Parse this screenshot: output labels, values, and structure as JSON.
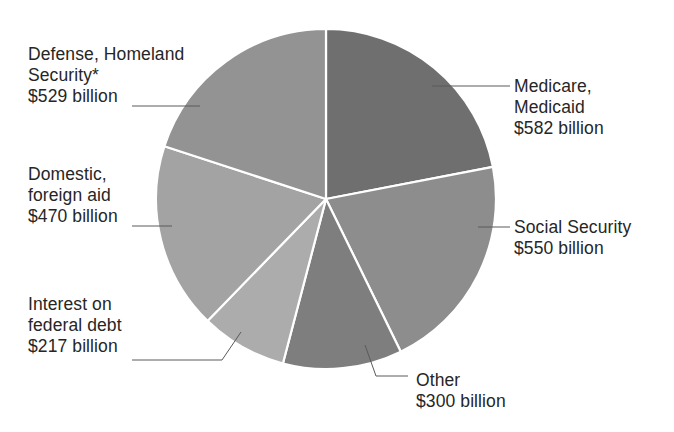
{
  "chart_data": {
    "type": "pie",
    "title": "",
    "unit": "billion USD",
    "start_angle_deg": 0,
    "direction": "clockwise",
    "slices": [
      {
        "name": "Medicare, Medicaid",
        "value": 582,
        "color": "#6f6f6f"
      },
      {
        "name": "Social Security",
        "value": 550,
        "color": "#8d8d8d"
      },
      {
        "name": "Other",
        "value": 300,
        "color": "#7e7e7e"
      },
      {
        "name": "Interest on federal debt",
        "value": 217,
        "color": "#acacac"
      },
      {
        "name": "Domestic, foreign aid",
        "value": 470,
        "color": "#a3a3a3"
      },
      {
        "name": "Defense, Homeland Security*",
        "value": 529,
        "color": "#939393"
      }
    ],
    "total": 2648
  },
  "labels": {
    "medicare": {
      "line1": "Medicare,",
      "line2": "Medicaid",
      "value": "$582 billion"
    },
    "social_security": {
      "line1": "Social Security",
      "value": "$550 billion"
    },
    "other": {
      "line1": "Other",
      "value": "$300 billion"
    },
    "interest": {
      "line1": "Interest on",
      "line2": "federal debt",
      "value": "$217 billion"
    },
    "domestic": {
      "line1": "Domestic,",
      "line2": "foreign aid",
      "value": "$470 billion"
    },
    "defense": {
      "line1": "Defense, Homeland",
      "line2": "Security*",
      "value": "$529 billion"
    }
  },
  "style": {
    "separator_color": "#ffffff",
    "leader_color": "#555555",
    "center": [
      326,
      199
    ],
    "radius": 170
  }
}
